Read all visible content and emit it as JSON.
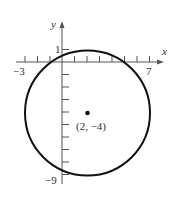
{
  "diagram": {
    "type": "circle-on-coordinate-plane",
    "axes": {
      "x_label": "x",
      "y_label": "y",
      "x_tick_labels": [
        "−3",
        "7"
      ],
      "y_tick_labels": [
        "1",
        "−9"
      ]
    },
    "circle": {
      "center": [
        2,
        -4
      ],
      "radius": 5,
      "center_label": "(2, −4)"
    },
    "colors": {
      "stroke": "#111111",
      "axis": "#555555",
      "text": "#333333"
    }
  }
}
